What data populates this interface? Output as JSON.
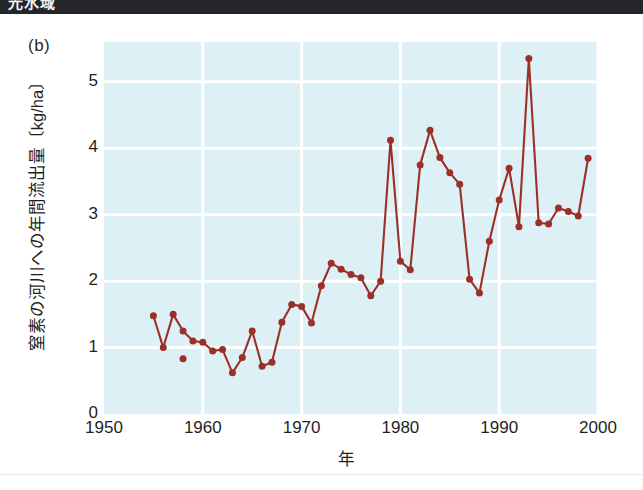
{
  "header": {
    "band_text": "光水域",
    "band_color": "#23252b"
  },
  "figure": {
    "panel_label": "(b)",
    "plot_background": "#dcf0f5",
    "gridline_color": "#ffffff",
    "series_color": "#9c3028",
    "axis_color": "#1f1f1f"
  },
  "chart_data": {
    "type": "line",
    "title": "(b)",
    "xlabel": "年",
    "ylabel": "窒素の河川への年間流出量〔kg/ha〕",
    "xlim": [
      1950,
      2000
    ],
    "ylim": [
      0,
      5.6
    ],
    "xticks": [
      1950,
      1960,
      1970,
      1980,
      1990,
      2000
    ],
    "yticks": [
      0,
      1,
      2,
      3,
      4,
      5
    ],
    "grid": true,
    "legend": "none",
    "marker": "circle",
    "series": [
      {
        "name": "窒素の河川への年間流出量",
        "x": [
          1955,
          1956,
          1957,
          1958,
          1959,
          1960,
          1961,
          1962,
          1963,
          1964,
          1965,
          1966,
          1967,
          1968,
          1969,
          1970,
          1971,
          1972,
          1973,
          1974,
          1975,
          1976,
          1977,
          1978,
          1979,
          1980,
          1981,
          1982,
          1983,
          1984,
          1985,
          1986,
          1987,
          1988,
          1989,
          1990,
          1991,
          1992,
          1993,
          1994,
          1995,
          1996,
          1997,
          1998,
          1999
        ],
        "values": [
          1.48,
          1.0,
          1.5,
          1.25,
          1.1,
          1.08,
          0.95,
          0.97,
          0.62,
          0.85,
          1.25,
          0.72,
          0.78,
          1.38,
          1.65,
          1.62,
          1.37,
          1.93,
          2.27,
          2.18,
          2.1,
          2.05,
          1.78,
          2.0,
          4.12,
          2.3,
          2.17,
          3.75,
          4.27,
          3.86,
          3.63,
          3.46,
          2.03,
          1.82,
          2.6,
          3.22,
          3.7,
          2.82,
          5.35,
          2.88,
          2.86,
          3.1,
          3.05,
          2.98,
          3.85
        ]
      },
      {
        "name": "孤立点",
        "style": "marker-only",
        "x": [
          1958
        ],
        "values": [
          0.83
        ]
      }
    ]
  },
  "ytick_labels": [
    "5",
    "4",
    "3",
    "2",
    "1",
    "0"
  ],
  "xtick_labels": [
    "1950",
    "1960",
    "1970",
    "1980",
    "1990",
    "2000"
  ]
}
